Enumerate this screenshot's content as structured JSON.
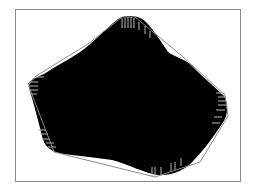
{
  "figure": {
    "colors": {
      "background": "#ffffff",
      "frame": "#8a8a8a",
      "blob_fill": "#000000",
      "hull_stroke": "#8a8a8a",
      "boundary_ticks": "#b8b8b8"
    },
    "frame": {
      "x": 15,
      "y": 9,
      "width": 225,
      "height": 172
    },
    "blob_path": "M118,19 C124,15 136,15 142,19 C150,24 160,40 168,52 C176,58 184,58 192,66 C204,78 216,88 224,96 C229,104 228,116 222,124 C214,136 204,150 194,160 C186,170 172,176 158,175 C146,174 128,164 112,160 C98,158 80,156 64,154 C50,152 44,146 42,136 C38,120 34,104 29,88 C28,82 34,78 44,74 C56,66 68,60 80,52 C92,44 104,30 118,19 Z",
    "hull_points": "122,17 135,17 182,56 225,95 228,116 200,162 155,177 54,152 28,84 36,76 88,44",
    "boundary_ticks": [
      {
        "x1": 122,
        "y1": 18,
        "x2": 122,
        "y2": 28
      },
      {
        "x1": 125,
        "y1": 18,
        "x2": 125,
        "y2": 28
      },
      {
        "x1": 128,
        "y1": 17,
        "x2": 128,
        "y2": 28
      },
      {
        "x1": 131,
        "y1": 17,
        "x2": 131,
        "y2": 28
      },
      {
        "x1": 134,
        "y1": 18,
        "x2": 134,
        "y2": 28
      },
      {
        "x1": 139,
        "y1": 22,
        "x2": 139,
        "y2": 30
      },
      {
        "x1": 145,
        "y1": 26,
        "x2": 145,
        "y2": 34
      },
      {
        "x1": 150,
        "y1": 31,
        "x2": 150,
        "y2": 38
      },
      {
        "x1": 29,
        "y1": 82,
        "x2": 38,
        "y2": 82
      },
      {
        "x1": 29,
        "y1": 86,
        "x2": 38,
        "y2": 86
      },
      {
        "x1": 29,
        "y1": 90,
        "x2": 38,
        "y2": 90
      },
      {
        "x1": 30,
        "y1": 94,
        "x2": 37,
        "y2": 94
      },
      {
        "x1": 36,
        "y1": 77,
        "x2": 44,
        "y2": 77
      },
      {
        "x1": 38,
        "y1": 130,
        "x2": 46,
        "y2": 130
      },
      {
        "x1": 40,
        "y1": 134,
        "x2": 48,
        "y2": 134
      },
      {
        "x1": 42,
        "y1": 139,
        "x2": 50,
        "y2": 139
      },
      {
        "x1": 46,
        "y1": 143,
        "x2": 54,
        "y2": 143
      },
      {
        "x1": 48,
        "y1": 147,
        "x2": 56,
        "y2": 147
      },
      {
        "x1": 216,
        "y1": 93,
        "x2": 225,
        "y2": 93
      },
      {
        "x1": 218,
        "y1": 97,
        "x2": 226,
        "y2": 97
      },
      {
        "x1": 218,
        "y1": 101,
        "x2": 226,
        "y2": 101
      },
      {
        "x1": 218,
        "y1": 105,
        "x2": 226,
        "y2": 105
      },
      {
        "x1": 216,
        "y1": 110,
        "x2": 225,
        "y2": 110
      },
      {
        "x1": 214,
        "y1": 117,
        "x2": 222,
        "y2": 117
      },
      {
        "x1": 212,
        "y1": 123,
        "x2": 220,
        "y2": 123
      },
      {
        "x1": 152,
        "y1": 167,
        "x2": 152,
        "y2": 176
      },
      {
        "x1": 155,
        "y1": 167,
        "x2": 155,
        "y2": 176
      },
      {
        "x1": 161,
        "y1": 167,
        "x2": 161,
        "y2": 176
      },
      {
        "x1": 171,
        "y1": 163,
        "x2": 171,
        "y2": 172
      },
      {
        "x1": 175,
        "y1": 162,
        "x2": 175,
        "y2": 170
      },
      {
        "x1": 181,
        "y1": 158,
        "x2": 181,
        "y2": 166
      }
    ]
  }
}
